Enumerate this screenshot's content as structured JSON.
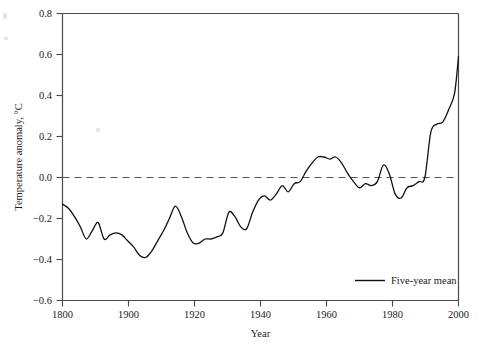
{
  "chart_data": {
    "type": "line",
    "title": "",
    "xlabel": "Year",
    "ylabel": "Temperature anomaly, °C",
    "xlim": [
      1800,
      2000
    ],
    "ylim": [
      -0.6,
      0.8
    ],
    "xticks": [
      1800,
      1900,
      1920,
      1940,
      1960,
      1980,
      2000
    ],
    "xticklabels": [
      "1800",
      "1900",
      "1920",
      "1940",
      "1960",
      "1980",
      "2000"
    ],
    "yticks": [
      -0.6,
      -0.4,
      -0.2,
      0.0,
      0.2,
      0.4,
      0.6,
      0.8
    ],
    "yticklabels": [
      "−0.6",
      "−0.4",
      "−0.2",
      "0.0",
      "0.2",
      "0.4",
      "0.6",
      "0.8"
    ],
    "grid": false,
    "legend_position": "lower right",
    "legend": [
      "Five-year mean"
    ],
    "reference_line": {
      "y": 0.0,
      "style": "dashed",
      "color": "#555555"
    },
    "line_color": "#111111",
    "series": [
      {
        "name": "Five-year mean",
        "x": [
          1800,
          1803,
          1806,
          1809,
          1812,
          1815,
          1818,
          1821,
          1824,
          1827,
          1830,
          1833,
          1836,
          1839,
          1842,
          1845,
          1848,
          1851,
          1854,
          1857,
          1860,
          1863,
          1866,
          1869,
          1872,
          1875,
          1878,
          1881,
          1884,
          1887,
          1890,
          1893,
          1896,
          1899,
          1902,
          1905,
          1908,
          1911,
          1914,
          1917,
          1920,
          1923,
          1926,
          1929,
          1932,
          1935,
          1938,
          1941,
          1944,
          1947,
          1950,
          1953,
          1956,
          1959,
          1962,
          1965,
          1968,
          1971,
          1974,
          1977,
          1980,
          1983,
          1986,
          1989,
          1992,
          1995,
          1998,
          2000
        ],
        "y": [
          -0.13,
          -0.15,
          -0.19,
          -0.24,
          -0.3,
          -0.26,
          -0.22,
          -0.3,
          -0.28,
          -0.27,
          -0.28,
          -0.31,
          -0.34,
          -0.38,
          -0.39,
          -0.36,
          -0.31,
          -0.26,
          -0.2,
          -0.14,
          -0.19,
          -0.27,
          -0.32,
          -0.32,
          -0.3,
          -0.3,
          -0.29,
          -0.27,
          -0.17,
          -0.19,
          -0.24,
          -0.25,
          -0.17,
          -0.11,
          -0.09,
          -0.11,
          -0.08,
          -0.04,
          -0.07,
          -0.03,
          -0.02,
          0.03,
          0.07,
          0.1,
          0.1,
          0.09,
          0.1,
          0.07,
          0.02,
          -0.02,
          -0.05,
          -0.03,
          -0.04,
          -0.02,
          0.06,
          0.02,
          -0.08,
          -0.1,
          -0.05,
          -0.04,
          -0.02,
          0.0,
          0.22,
          0.26,
          0.27,
          0.33,
          0.41,
          0.59
        ]
      }
    ]
  },
  "legend_entry": "Five-year mean",
  "axis": {
    "x_title": "Year",
    "y_title": "Temperature anomaly, °C"
  }
}
